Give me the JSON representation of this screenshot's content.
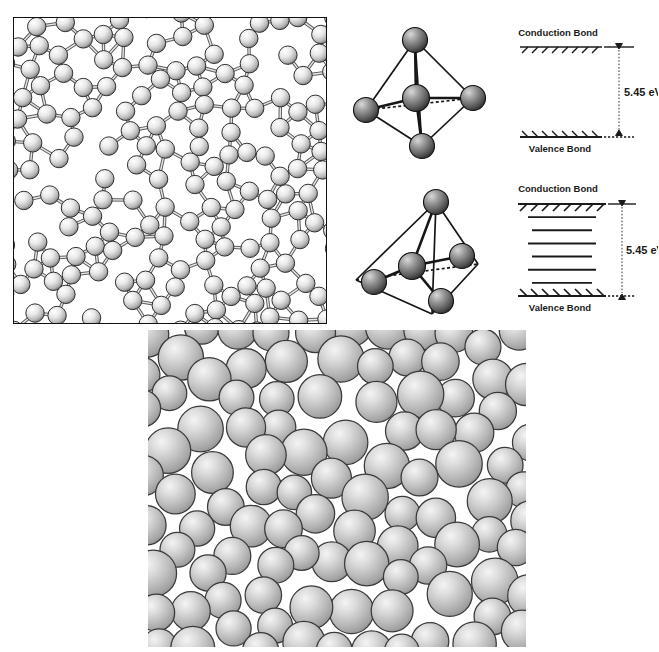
{
  "figure": {
    "background_color": "#ffffff",
    "ink_color": "#1a1a1a"
  },
  "panel_network": {
    "name": "continuous-random-network",
    "description": "Continuous random network of atoms joined by bonds",
    "border_color": "#111111",
    "atom_fill": "#f2f2f2",
    "atom_stroke": "#303030",
    "bond_color": "#555555",
    "atom_count": 168,
    "seed": 20231,
    "x": 13,
    "y": 17,
    "width": 312,
    "height": 305
  },
  "panel_tetrahedra": [
    {
      "name": "tetrahedron-crystalline",
      "label": "",
      "distorted": false,
      "atom_fill": "#8a8a8a",
      "atom_stroke": "#101010",
      "edge_color": "#141414",
      "vertex_count": 4,
      "center_atom": true
    },
    {
      "name": "tetrahedron-amorphous",
      "label": "",
      "distorted": true,
      "atom_fill": "#8a8a8a",
      "atom_stroke": "#101010",
      "edge_color": "#141414",
      "vertex_count": 4,
      "center_atom": true
    }
  ],
  "band_diagrams": [
    {
      "name": "band-diagram-crystalline",
      "conduction_label": "Conduction Bond",
      "valence_label": "Valence Bond",
      "gap_label": "5.45 eV",
      "gap_value": 5.45,
      "gap_unit": "eV",
      "localized_states": 0,
      "hatched_bands": true
    },
    {
      "name": "band-diagram-amorphous",
      "conduction_label": "Conduction Bond",
      "valence_label": "Valence Bond",
      "gap_label": "5.45 eV",
      "gap_value": 5.45,
      "gap_unit": "eV",
      "localized_states": 6,
      "hatched_bands": true
    }
  ],
  "panel_packing": {
    "name": "dense-random-sphere-packing",
    "description": "Dense random packing of equal hard spheres",
    "sphere_fill_light": "#efefef",
    "sphere_fill_mid": "#b8b8b8",
    "sphere_fill_dark": "#8f8f8f",
    "sphere_stroke": "#3a3a3a",
    "sphere_count": 190,
    "seed": 77411,
    "x": 148,
    "y": 330,
    "width": 378,
    "height": 317
  },
  "chart_data": {
    "type": "table",
    "categories": [
      "Crystalline",
      "Amorphous"
    ],
    "series": [
      {
        "name": "Band gap (eV)",
        "values": [
          5.45,
          5.45
        ]
      },
      {
        "name": "Localized states in gap",
        "values": [
          0,
          6
        ]
      }
    ],
    "ylabel": "Energy",
    "xlabel": ""
  }
}
